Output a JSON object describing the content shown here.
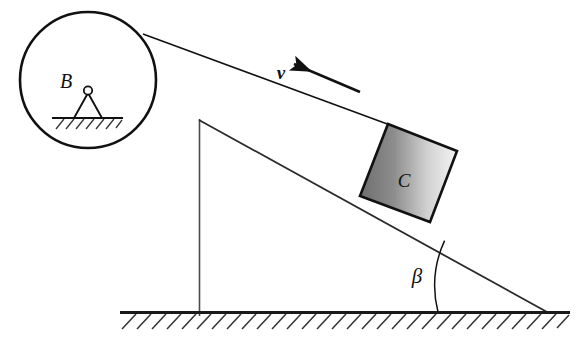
{
  "figure": {
    "background_color": "#ffffff",
    "stroke_color": "#1a1a1a",
    "width": 583,
    "height": 349
  },
  "labels": {
    "pulley_support": "B",
    "block": "C",
    "angle": "β",
    "velocity": "v"
  },
  "elements": {
    "pulley_name": "pulley-circle",
    "support_name": "pivot-support",
    "ground_name": "ground-line",
    "incline_name": "incline-surface",
    "cord_name": "cord-line",
    "block_name": "sliding-block",
    "arrow_name": "velocity-arrow",
    "angle_arc_name": "angle-arc",
    "vertical_name": "vertical-leg"
  },
  "geometry": {
    "pulley": {
      "cx": 88,
      "cy": 80,
      "r": 68
    },
    "pivot": {
      "x": 88,
      "y": 91,
      "hinge_r": 4.5
    },
    "support_ground": {
      "x1": 52,
      "y1": 118,
      "x2": 122,
      "y2": 118
    },
    "ground": {
      "x1": 120,
      "y1": 312,
      "x2": 570,
      "y2": 312
    },
    "incline_apex": {
      "x": 199,
      "y": 120
    },
    "incline_base": {
      "x": 546,
      "y": 312
    },
    "vertical_leg": {
      "x": 199,
      "y1": 120,
      "y2": 315
    },
    "cord": {
      "x1": 143,
      "y1": 34,
      "x2": 389,
      "y2": 125
    },
    "block_corners": [
      {
        "x": 388,
        "y": 124
      },
      {
        "x": 457,
        "y": 151
      },
      {
        "x": 430,
        "y": 222
      },
      {
        "x": 360,
        "y": 196
      }
    ],
    "velocity_arrow": {
      "tail_x": 360,
      "tail_y": 92,
      "head_x": 289,
      "head_y": 62
    },
    "angle_arc": {
      "vertex_x": 546,
      "vertex_y": 312,
      "radius": 108
    }
  },
  "colors": {
    "line": "#1a1a1a",
    "block_gradient_dark": "#6e6e6e",
    "block_gradient_light": "#f2f2f2",
    "block_border": "#111111",
    "hatch": "#333333"
  }
}
